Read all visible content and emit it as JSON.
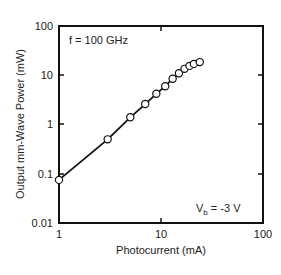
{
  "chart_data": {
    "type": "scatter",
    "title": "",
    "xlabel": "Photocurrent (mA)",
    "ylabel": "Output mm-Wave Power (mW)",
    "xscale": "log",
    "yscale": "log",
    "xlim": [
      1,
      100
    ],
    "ylim": [
      0.01,
      100
    ],
    "x_ticks": [
      "1",
      "10",
      "100"
    ],
    "y_ticks": [
      "0.01",
      "0.1",
      "1",
      "10",
      "100"
    ],
    "grid": false,
    "legend": null,
    "annotations": [
      "f = 100 GHz",
      "Vb = -3 V"
    ],
    "series": [
      {
        "name": "measured",
        "marker": "open-circle",
        "x": [
          1,
          3,
          5,
          7,
          9,
          11,
          13,
          15,
          17,
          19,
          21,
          24
        ],
        "y": [
          0.075,
          0.5,
          1.4,
          2.6,
          4.2,
          6.0,
          8.5,
          11,
          13.5,
          15.5,
          17,
          18.5
        ]
      },
      {
        "name": "fit",
        "style": "solid-line",
        "x": [
          1,
          24
        ],
        "y": [
          0.075,
          18.5
        ]
      }
    ]
  },
  "labels": {
    "x_axis_title": "Photocurrent (mA)",
    "y_axis_title": "Output mm-Wave Power (mW)",
    "freq_annotation": "f = 100 GHz",
    "bias_prefix": "V",
    "bias_sub": "b",
    "bias_value": " = -3 V",
    "x_tick_1": "1",
    "x_tick_10": "10",
    "x_tick_100": "100",
    "y_tick_001": "0.01",
    "y_tick_01": "0.1",
    "y_tick_1": "1",
    "y_tick_10": "10",
    "y_tick_100": "100"
  }
}
